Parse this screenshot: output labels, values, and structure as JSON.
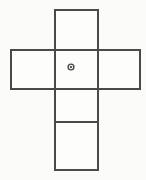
{
  "diagram": {
    "background_color": "#fbfbfa",
    "face_fill_color": "#fdfdfc",
    "stroke_color": "#4a4a4a",
    "stroke_width": 2,
    "marker_color": "#3d3d3d",
    "canvas": {
      "width": 146,
      "height": 180
    },
    "faces": [
      {
        "name": "top-face",
        "label": "top",
        "x": 55,
        "y": 10,
        "width": 43,
        "height": 40
      },
      {
        "name": "left-face",
        "label": "left",
        "x": 11,
        "y": 50,
        "width": 44,
        "height": 39
      },
      {
        "name": "center-face",
        "label": "center",
        "x": 55,
        "y": 50,
        "width": 43,
        "height": 39
      },
      {
        "name": "right-face",
        "label": "right",
        "x": 98,
        "y": 50,
        "width": 42,
        "height": 39
      },
      {
        "name": "lower-face",
        "label": "lower",
        "x": 55,
        "y": 89,
        "width": 43,
        "height": 33
      },
      {
        "name": "bottom-face",
        "label": "bottom",
        "x": 55,
        "y": 122,
        "width": 43,
        "height": 48
      }
    ],
    "edges": [
      {
        "name": "top-face-outline",
        "points": "55,10 98,10 98,50 55,50 55,10"
      },
      {
        "name": "horizontal-bar-outline",
        "points": "11,50 140,50 140,89 11,89 11,50"
      },
      {
        "name": "lower-column-outline",
        "points": "55,89 98,89 98,170 55,170 55,89"
      },
      {
        "name": "divider-lower-bottom",
        "points": "55,122 98,122"
      },
      {
        "name": "vertical-left-column-edge",
        "points": "55,50 55,89"
      },
      {
        "name": "vertical-right-column-edge",
        "points": "98,50 98,89"
      }
    ],
    "center_marker": {
      "name": "center-point-marker",
      "label": "center point",
      "cx": 71,
      "cy": 67,
      "outer_radius": 3.6,
      "inner_radius": 2.2,
      "core_radius": 1.1
    }
  }
}
